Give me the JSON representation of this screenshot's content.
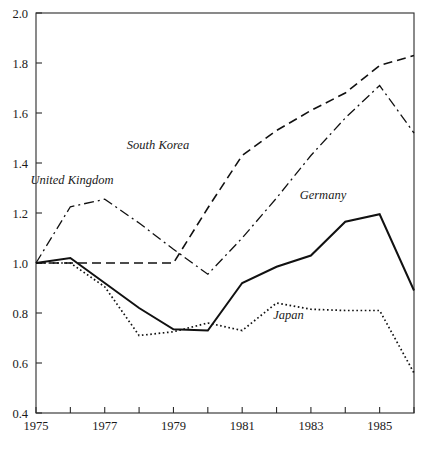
{
  "chart_data": {
    "type": "line",
    "title": "",
    "subtitle": "",
    "xlabel": "",
    "ylabel": "",
    "xlim": [
      1975,
      1986
    ],
    "ylim": [
      0.4,
      2.0
    ],
    "grid": false,
    "legend_position": "inline-annotations",
    "x": [
      1975,
      1976,
      1977,
      1978,
      1979,
      1980,
      1981,
      1982,
      1983,
      1984,
      1985,
      1986
    ],
    "x_tick_values": [
      1975,
      1976,
      1977,
      1978,
      1979,
      1980,
      1981,
      1982,
      1983,
      1984,
      1985,
      1986
    ],
    "x_tick_labels": [
      "1975",
      "",
      "1977",
      "",
      "1979",
      "",
      "1981",
      "",
      "1983",
      "",
      "1985",
      ""
    ],
    "y_tick_values": [
      0.4,
      0.6,
      0.8,
      1.0,
      1.2,
      1.4,
      1.6,
      1.8,
      2.0
    ],
    "y_tick_labels": [
      "0.4",
      "0.6",
      "0.8",
      "1.0",
      "1.2",
      "1.4",
      "1.6",
      "1.8",
      "2.0"
    ],
    "series": [
      {
        "name": "South Korea",
        "style": "dashed",
        "dasharray": "9,5",
        "width": 1.6,
        "color": "#111111",
        "values": [
          1.0,
          1.0,
          1.0,
          1.0,
          1.0,
          1.22,
          1.43,
          1.53,
          1.61,
          1.68,
          1.79,
          1.83
        ],
        "label": "South Korea",
        "label_x": 1978.55,
        "label_y": 1.455
      },
      {
        "name": "United Kingdom",
        "style": "dash-dot",
        "dasharray": "10,4,2,4",
        "width": 1.3,
        "color": "#111111",
        "values": [
          1.0,
          1.225,
          1.255,
          1.16,
          1.055,
          0.955,
          1.1,
          1.26,
          1.43,
          1.58,
          1.71,
          1.52
        ],
        "label": "United Kingdom",
        "label_x": 1976.05,
        "label_y": 1.315
      },
      {
        "name": "Germany",
        "style": "solid",
        "dasharray": "",
        "width": 2.0,
        "color": "#111111",
        "values": [
          1.0,
          1.02,
          0.92,
          0.82,
          0.735,
          0.73,
          0.92,
          0.985,
          1.03,
          1.165,
          1.195,
          0.89
        ],
        "label": "Germany",
        "label_x": 1983.35,
        "label_y": 1.255
      },
      {
        "name": "Japan",
        "style": "dotted",
        "dasharray": "1.6,2.6",
        "width": 1.7,
        "color": "#111111",
        "values": [
          1.0,
          1.0,
          0.905,
          0.71,
          0.725,
          0.76,
          0.73,
          0.84,
          0.815,
          0.81,
          0.81,
          0.56
        ],
        "label": "Japan",
        "label_x": 1982.35,
        "label_y": 0.775
      }
    ]
  },
  "axes": {
    "plot_left_px": 36,
    "plot_right_px": 414,
    "plot_top_px": 13,
    "plot_bottom_px": 413
  }
}
